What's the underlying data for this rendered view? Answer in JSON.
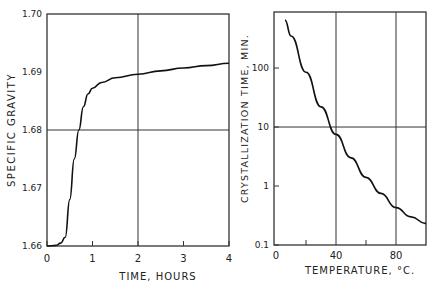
{
  "chart_data": [
    {
      "type": "line",
      "title": "",
      "xlabel": "TIME, HOURS",
      "ylabel": "SPECIFIC GRAVITY",
      "xlim": [
        0,
        4
      ],
      "ylim": [
        1.66,
        1.7
      ],
      "xticks": [
        "0",
        "1",
        "2",
        "3",
        "4"
      ],
      "yticks": [
        "1.66",
        "1.67",
        "1.68",
        "1.69",
        "1.70"
      ],
      "grid": "x=2, y=1.68",
      "x": [
        0,
        0.2,
        0.3,
        0.4,
        0.5,
        0.6,
        0.7,
        0.8,
        0.9,
        1.0,
        1.2,
        1.5,
        2.0,
        2.5,
        3.0,
        3.5,
        4.0
      ],
      "y": [
        1.66,
        1.6601,
        1.6605,
        1.6615,
        1.668,
        1.675,
        1.68,
        1.684,
        1.6862,
        1.6872,
        1.6882,
        1.689,
        1.6896,
        1.6902,
        1.6907,
        1.6911,
        1.6915
      ]
    },
    {
      "type": "line",
      "title": "",
      "xlabel": "TEMPERATURE, °C.",
      "ylabel": "CRYSTALLIZATION TIME, MIN.",
      "yscale": "log",
      "xlim": [
        0,
        100
      ],
      "ylim": [
        0.1,
        1000
      ],
      "xticks": [
        "0",
        "40",
        "80"
      ],
      "yticks": [
        "0.1",
        "1",
        "10",
        "100"
      ],
      "grid": "x=40,80; y=10",
      "x": [
        6,
        10,
        20,
        30,
        40,
        50,
        60,
        70,
        80,
        90,
        100
      ],
      "y": [
        650,
        350,
        85,
        22,
        7.5,
        3.0,
        1.4,
        0.75,
        0.43,
        0.3,
        0.23
      ]
    }
  ]
}
